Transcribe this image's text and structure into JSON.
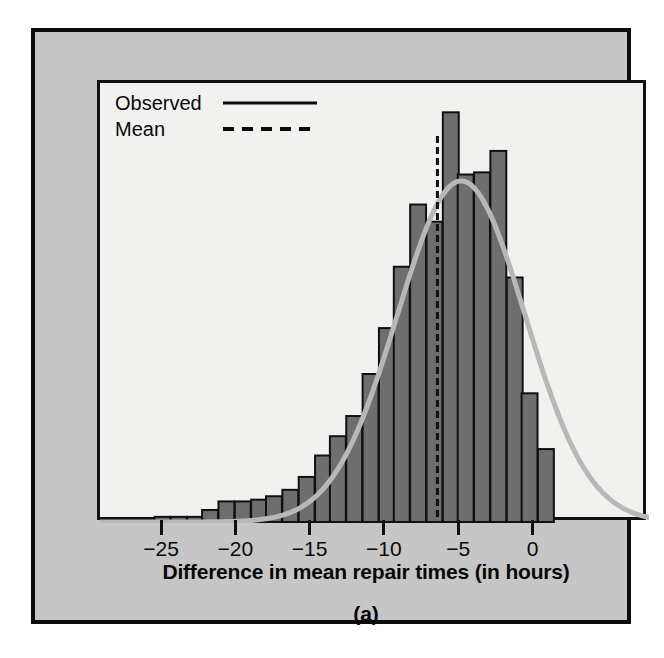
{
  "figure": {
    "caption": "(a)",
    "axis_title": "Difference in mean repair times (in hours)",
    "colors": {
      "panel_background": "#c6c6c6",
      "plot_background": "#f1f1f0",
      "bar_fill": "#6e6e6e",
      "bar_outline": "#111111",
      "curve": "#b8b8b8",
      "mean_line": "#111111",
      "frame": "#111111"
    }
  },
  "legend": {
    "position": "top-left",
    "entries": [
      {
        "label": "Observed",
        "style": "solid",
        "icon": "solid-line-icon"
      },
      {
        "label": "Mean",
        "style": "dashed",
        "icon": "dashed-line-icon"
      }
    ]
  },
  "chart_data": {
    "type": "bar",
    "title": "",
    "subtitle": "",
    "xlabel": "Difference in mean repair times (in hours)",
    "ylabel": "",
    "xlim": [
      -26.5,
      3.5
    ],
    "ylim": [
      0,
      1.0
    ],
    "grid": false,
    "legend_position": "top-left",
    "bin_width": 1.07,
    "x_ticks": [
      -25,
      -20,
      -15,
      -10,
      -5,
      0
    ],
    "x_tick_labels": [
      "−25",
      "−20",
      "−15",
      "−10",
      "−5",
      "0"
    ],
    "y_ticks": [],
    "y_tick_labels": [],
    "bin_centers": [
      -25.1,
      -24.0,
      -22.9,
      -21.9,
      -20.8,
      -19.7,
      -18.6,
      -17.6,
      -16.5,
      -15.4,
      -14.3,
      -13.3,
      -12.2,
      -11.1,
      -10.0,
      -9.0,
      -7.9,
      -6.8,
      -5.7,
      -4.7,
      -3.6,
      -2.5,
      -1.4,
      -0.4,
      0.7
    ],
    "values": [
      0.012,
      0.012,
      0.012,
      0.028,
      0.048,
      0.048,
      0.052,
      0.06,
      0.075,
      0.105,
      0.155,
      0.2,
      0.247,
      0.345,
      0.452,
      0.595,
      0.74,
      0.7,
      0.955,
      0.81,
      0.815,
      0.865,
      0.57,
      0.3,
      0.17,
      0.065
    ],
    "series": [
      {
        "name": "Observed",
        "type": "line",
        "style": "smooth-normal-curve",
        "peak_x": -5.0,
        "peak_y": 0.795,
        "mean": -6.6,
        "sd": 4.3
      },
      {
        "name": "Mean",
        "type": "vline",
        "style": "dashed",
        "x": -6.6
      }
    ],
    "annotations": [
      {
        "text": "(a)",
        "role": "panel-caption"
      }
    ]
  },
  "x_axis": {
    "ticks": [
      {
        "label": "−25",
        "value": -25
      },
      {
        "label": "−20",
        "value": -20
      },
      {
        "label": "−15",
        "value": -15
      },
      {
        "label": "−10",
        "value": -10
      },
      {
        "label": "−5",
        "value": -5
      },
      {
        "label": "0",
        "value": 0
      }
    ]
  }
}
